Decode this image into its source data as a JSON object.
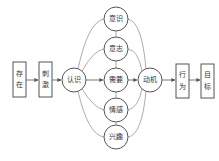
{
  "diagram": {
    "type": "flow",
    "nodes": {
      "existence": "存在",
      "existence_chars": [
        "存",
        "在"
      ],
      "stimulus": "刺激",
      "stimulus_chars": [
        "刺",
        "激"
      ],
      "cognition": "认识",
      "consciousness": "意识",
      "will": "意志",
      "need": "需要",
      "emotion": "情感",
      "interest": "兴趣",
      "motivation": "动机",
      "behavior": "行为",
      "behavior_chars": [
        "行",
        "为"
      ],
      "goal": "目标",
      "goal_chars": [
        "目",
        "标"
      ]
    },
    "edges": [
      [
        "存在",
        "刺激"
      ],
      [
        "刺激",
        "认识"
      ],
      [
        "认识",
        "需要"
      ],
      [
        "需要",
        "动机"
      ],
      [
        "动机",
        "行为"
      ],
      [
        "行为",
        "目标"
      ],
      [
        "认识",
        "意识"
      ],
      [
        "认识",
        "意志"
      ],
      [
        "认识",
        "情感"
      ],
      [
        "认识",
        "兴趣"
      ],
      [
        "意识",
        "动机"
      ],
      [
        "意志",
        "动机"
      ],
      [
        "情感",
        "动机"
      ],
      [
        "兴趣",
        "动机"
      ],
      [
        "意识",
        "意志"
      ],
      [
        "意志",
        "需要"
      ],
      [
        "需要",
        "情感"
      ],
      [
        "情感",
        "兴趣"
      ]
    ]
  }
}
